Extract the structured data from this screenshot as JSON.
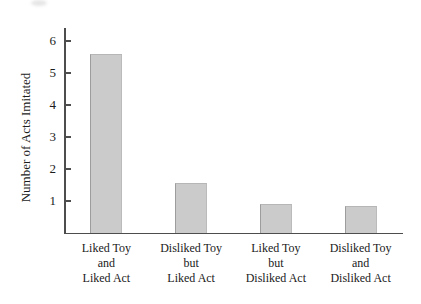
{
  "figure": {
    "background_color": "#ffffff",
    "axis_color": "#4d4d4d",
    "text_color": "#1c1c1c"
  },
  "chart_data": {
    "type": "bar",
    "ylabel": "Number of Acts Imitated",
    "categories": [
      [
        "Liked Toy",
        "and",
        "Liked Act"
      ],
      [
        "Disliked Toy",
        "but",
        "Liked Act"
      ],
      [
        "Liked Toy",
        "but",
        "Disliked Act"
      ],
      [
        "Disliked Toy",
        "and",
        "Disliked Act"
      ]
    ],
    "values": [
      5.6,
      1.55,
      0.9,
      0.85
    ],
    "yticks": [
      1,
      2,
      3,
      4,
      5,
      6
    ],
    "ylim": [
      0,
      6.4
    ],
    "bar_color": "#cbcbcb",
    "grid": false,
    "legend": null
  }
}
